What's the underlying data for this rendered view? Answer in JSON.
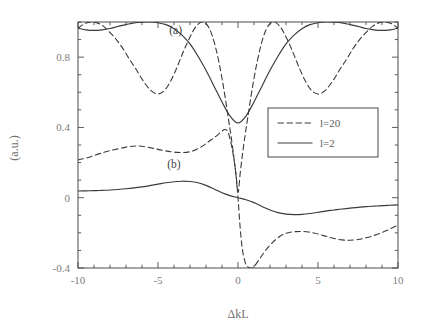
{
  "chart_data": {
    "type": "line",
    "title": "",
    "xlabel": "ΔkL",
    "ylabel": "(a.u.)",
    "xlim": [
      -10,
      10
    ],
    "ylim": [
      -0.4,
      1.0
    ],
    "grid": false,
    "legend_position": "center-right",
    "xticks": [
      -10,
      -5,
      0,
      5,
      10
    ],
    "xticklabels": [
      "-10",
      "-5",
      "0",
      "5",
      "10"
    ],
    "yticks": [
      -0.4,
      0,
      0.4,
      0.8
    ],
    "yticklabels": [
      "-0.4",
      "0",
      "0.4",
      "0.8"
    ],
    "annotations": [
      {
        "text": "(a)",
        "x": -3.9,
        "y": 0.93,
        "note": "upper pair of curves"
      },
      {
        "text": "(b)",
        "x": -4.0,
        "y": 0.17,
        "note": "lower pair of curves"
      }
    ],
    "legend": [
      {
        "label": "l=20",
        "style": "dashed"
      },
      {
        "label": "l=2",
        "style": "solid"
      }
    ],
    "series": [
      {
        "name": "(a) l=20",
        "group": "a",
        "style": "dashed",
        "x": [
          -10.0,
          -9.6,
          -9.2,
          -8.8,
          -8.4,
          -8.0,
          -7.6,
          -7.2,
          -6.8,
          -6.4,
          -6.0,
          -5.6,
          -5.3,
          -5.0,
          -4.6,
          -4.2,
          -3.8,
          -3.4,
          -3.0,
          -2.7,
          -2.4,
          -2.2,
          -2.0,
          -1.8,
          -1.6,
          -1.4,
          -1.2,
          -1.0,
          -0.8,
          -0.6,
          -0.45,
          -0.3,
          -0.15,
          0.0,
          0.15,
          0.3,
          0.45,
          0.6,
          0.8,
          1.0,
          1.2,
          1.4,
          1.6,
          1.8,
          2.0,
          2.2,
          2.4,
          2.7,
          3.0,
          3.4,
          3.8,
          4.2,
          4.6,
          5.0,
          5.3,
          5.6,
          6.0,
          6.4,
          6.8,
          7.2,
          7.6,
          8.0,
          8.4,
          8.8,
          9.2,
          9.6,
          10.0
        ],
        "y": [
          0.965,
          0.99,
          1.0,
          0.995,
          0.975,
          0.94,
          0.9,
          0.85,
          0.79,
          0.735,
          0.675,
          0.625,
          0.6,
          0.59,
          0.61,
          0.665,
          0.745,
          0.835,
          0.915,
          0.965,
          0.995,
          1.0,
          0.99,
          0.965,
          0.92,
          0.855,
          0.775,
          0.68,
          0.57,
          0.45,
          0.36,
          0.26,
          0.15,
          0.03,
          0.15,
          0.26,
          0.36,
          0.45,
          0.57,
          0.68,
          0.775,
          0.855,
          0.92,
          0.965,
          0.99,
          1.0,
          0.995,
          0.965,
          0.915,
          0.835,
          0.745,
          0.665,
          0.61,
          0.59,
          0.6,
          0.625,
          0.675,
          0.735,
          0.79,
          0.85,
          0.9,
          0.94,
          0.975,
          0.995,
          1.0,
          0.99,
          0.965
        ]
      },
      {
        "name": "(a) l=2",
        "group": "a",
        "style": "solid",
        "x": [
          -10.0,
          -9.5,
          -9.0,
          -8.5,
          -8.0,
          -7.5,
          -7.0,
          -6.5,
          -6.0,
          -5.5,
          -5.0,
          -4.5,
          -4.0,
          -3.5,
          -3.0,
          -2.5,
          -2.0,
          -1.5,
          -1.0,
          -0.5,
          0.0,
          0.5,
          1.0,
          1.5,
          2.0,
          2.5,
          3.0,
          3.5,
          4.0,
          4.5,
          5.0,
          5.5,
          6.0,
          6.5,
          7.0,
          7.5,
          8.0,
          8.5,
          9.0,
          9.5,
          10.0
        ],
        "y": [
          0.965,
          0.955,
          0.952,
          0.955,
          0.963,
          0.975,
          0.985,
          0.995,
          0.999,
          1.0,
          0.996,
          0.985,
          0.962,
          0.925,
          0.875,
          0.805,
          0.725,
          0.635,
          0.545,
          0.465,
          0.425,
          0.465,
          0.545,
          0.635,
          0.725,
          0.805,
          0.875,
          0.925,
          0.962,
          0.985,
          0.996,
          1.0,
          0.999,
          0.995,
          0.985,
          0.975,
          0.963,
          0.955,
          0.952,
          0.955,
          0.965
        ]
      },
      {
        "name": "(b) l=20",
        "group": "b",
        "style": "dashed",
        "x": [
          -10.0,
          -9.5,
          -9.0,
          -8.5,
          -8.0,
          -7.5,
          -7.0,
          -6.6,
          -6.2,
          -5.8,
          -5.4,
          -5.0,
          -4.6,
          -4.2,
          -3.8,
          -3.4,
          -3.0,
          -2.6,
          -2.2,
          -1.9,
          -1.6,
          -1.3,
          -1.0,
          -0.85,
          -0.7,
          -0.6,
          -0.5,
          -0.4,
          -0.3,
          -0.2,
          -0.1,
          0.0,
          0.1,
          0.2,
          0.3,
          0.45,
          0.6,
          0.8,
          1.0,
          1.3,
          1.6,
          2.0,
          2.4,
          2.8,
          3.2,
          3.6,
          4.0,
          4.4,
          4.8,
          5.2,
          5.6,
          6.0,
          6.5,
          7.0,
          7.5,
          8.0,
          8.5,
          9.0,
          9.5,
          10.0
        ],
        "y": [
          0.215,
          0.225,
          0.24,
          0.255,
          0.268,
          0.278,
          0.288,
          0.293,
          0.294,
          0.29,
          0.283,
          0.275,
          0.268,
          0.262,
          0.258,
          0.257,
          0.262,
          0.275,
          0.295,
          0.315,
          0.335,
          0.355,
          0.378,
          0.388,
          0.385,
          0.368,
          0.335,
          0.295,
          0.245,
          0.185,
          0.11,
          0.0,
          -0.13,
          -0.235,
          -0.31,
          -0.368,
          -0.392,
          -0.4,
          -0.392,
          -0.355,
          -0.315,
          -0.27,
          -0.235,
          -0.21,
          -0.198,
          -0.193,
          -0.192,
          -0.195,
          -0.202,
          -0.212,
          -0.222,
          -0.232,
          -0.24,
          -0.242,
          -0.238,
          -0.228,
          -0.215,
          -0.198,
          -0.178,
          -0.155
        ]
      },
      {
        "name": "(b) l=2",
        "group": "b",
        "style": "solid",
        "x": [
          -10.0,
          -9.5,
          -9.0,
          -8.5,
          -8.0,
          -7.5,
          -7.0,
          -6.5,
          -6.0,
          -5.5,
          -5.0,
          -4.5,
          -4.0,
          -3.5,
          -3.0,
          -2.5,
          -2.0,
          -1.5,
          -1.0,
          -0.5,
          0.0,
          0.5,
          1.0,
          1.5,
          2.0,
          2.5,
          3.0,
          3.5,
          4.0,
          4.5,
          5.0,
          5.5,
          6.0,
          6.5,
          7.0,
          7.5,
          8.0,
          8.5,
          9.0,
          9.5,
          10.0
        ],
        "y": [
          0.038,
          0.039,
          0.04,
          0.042,
          0.044,
          0.047,
          0.051,
          0.056,
          0.062,
          0.069,
          0.077,
          0.085,
          0.091,
          0.094,
          0.092,
          0.085,
          0.07,
          0.05,
          0.028,
          0.012,
          0.0,
          -0.012,
          -0.028,
          -0.05,
          -0.07,
          -0.085,
          -0.093,
          -0.096,
          -0.095,
          -0.09,
          -0.083,
          -0.076,
          -0.07,
          -0.064,
          -0.059,
          -0.055,
          -0.051,
          -0.048,
          -0.045,
          -0.043,
          -0.041
        ]
      }
    ]
  },
  "axes": {
    "x_title": "ΔkL",
    "y_title": "(a.u.)"
  },
  "colors": {
    "line": "#3a3a3a",
    "frame": "#4a4a4a",
    "tick_label": "#7d7d7d",
    "background": "#ffffff"
  }
}
